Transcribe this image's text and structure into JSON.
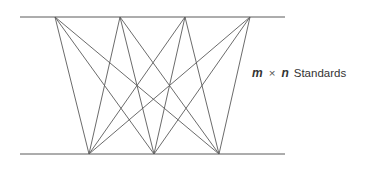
{
  "diagram": {
    "label": {
      "m": "m",
      "times": "×",
      "n": "n",
      "word": "Standards"
    },
    "colors": {
      "line": "#5a5a5a",
      "text": "#333333"
    },
    "top_rail": {
      "x1": 20,
      "x2": 285,
      "y": 17
    },
    "bottom_rail": {
      "x1": 20,
      "x2": 285,
      "y": 154
    },
    "top_nodes": [
      55,
      120,
      185,
      250
    ],
    "bottom_nodes": [
      89,
      154,
      219
    ]
  }
}
